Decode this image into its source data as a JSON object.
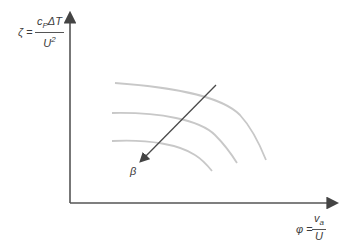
{
  "diagram": {
    "type": "compressor characteristic sketch",
    "y_axis": {
      "symbol": "ζ",
      "equals": "=",
      "numerator_main": "c",
      "numerator_sub": "P",
      "numerator_rest": "ΔT",
      "denominator_main": "U",
      "denominator_sup": "2"
    },
    "x_axis": {
      "symbol": "φ",
      "equals": "=",
      "numerator_main": "v",
      "numerator_sub": "a",
      "denominator_main": "U"
    },
    "curves": [
      {
        "name": "curve-1"
      },
      {
        "name": "curve-2"
      },
      {
        "name": "curve-3"
      }
    ],
    "arrow_label": "β",
    "colors": {
      "axis": "#555555",
      "curve": "#c8c8c8",
      "arrow": "#4a4a4a"
    }
  }
}
